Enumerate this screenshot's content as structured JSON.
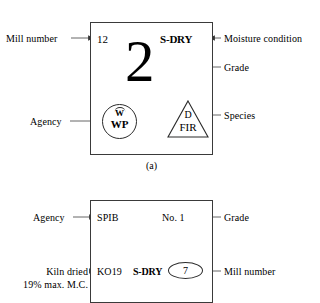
{
  "figure": {
    "title_caption_a": "(a)",
    "panels": [
      {
        "id": "a",
        "stamp": {
          "mill_number": "12",
          "moisture_condition": "S-DRY",
          "grade": "2",
          "agency_mark": {
            "top_letter": "W",
            "bottom_letters": "WP",
            "shape": "circle"
          },
          "species_mark": {
            "top_letter": "D",
            "bottom_letters": "FIR",
            "shape": "triangle"
          }
        },
        "callouts": {
          "mill_number": "Mill number",
          "moisture_condition": "Moisture condition",
          "grade": "Grade",
          "agency": "Agency",
          "species": "Species"
        }
      },
      {
        "id": "b",
        "stamp": {
          "agency": "SPIB",
          "grade": "No. 1",
          "kiln_code": "KO19",
          "moisture_condition": "S-DRY",
          "mill_number": "7"
        },
        "callouts": {
          "agency": "Agency",
          "grade": "Grade",
          "kiln_dried_line1": "Kiln dried",
          "kiln_dried_line2": "19% max. M.C.",
          "mill_number": "Mill number"
        }
      }
    ]
  },
  "colors": {
    "ink": "#000000",
    "box_border": "#3a3a3a",
    "leader_line": "#555555",
    "background": "#ffffff"
  }
}
